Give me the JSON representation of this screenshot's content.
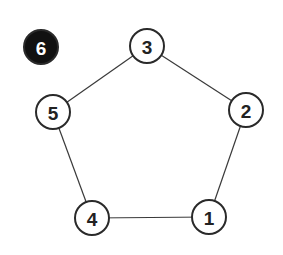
{
  "graph": {
    "description": "Pentagon cycle graph with one isolated highlighted node",
    "node_radius": 17,
    "colors": {
      "background": "#ffffff",
      "edge": "#3a3a3a",
      "node_fill": "#ffffff",
      "node_stroke": "#2a2a2a",
      "node_text": "#222222",
      "highlight_fill": "#111111",
      "highlight_text": "#ffffff"
    },
    "nodes": [
      {
        "id": "1",
        "label": "1",
        "x": 209,
        "y": 217,
        "highlighted": false
      },
      {
        "id": "2",
        "label": "2",
        "x": 246,
        "y": 110,
        "highlighted": false
      },
      {
        "id": "3",
        "label": "3",
        "x": 147,
        "y": 46,
        "highlighted": false
      },
      {
        "id": "4",
        "label": "4",
        "x": 92,
        "y": 218,
        "highlighted": false
      },
      {
        "id": "5",
        "label": "5",
        "x": 53,
        "y": 112,
        "highlighted": false
      },
      {
        "id": "6",
        "label": "6",
        "x": 41,
        "y": 47,
        "highlighted": true
      }
    ],
    "edges": [
      {
        "from": "3",
        "to": "5"
      },
      {
        "from": "3",
        "to": "2"
      },
      {
        "from": "2",
        "to": "1"
      },
      {
        "from": "5",
        "to": "4"
      },
      {
        "from": "4",
        "to": "1"
      }
    ]
  }
}
